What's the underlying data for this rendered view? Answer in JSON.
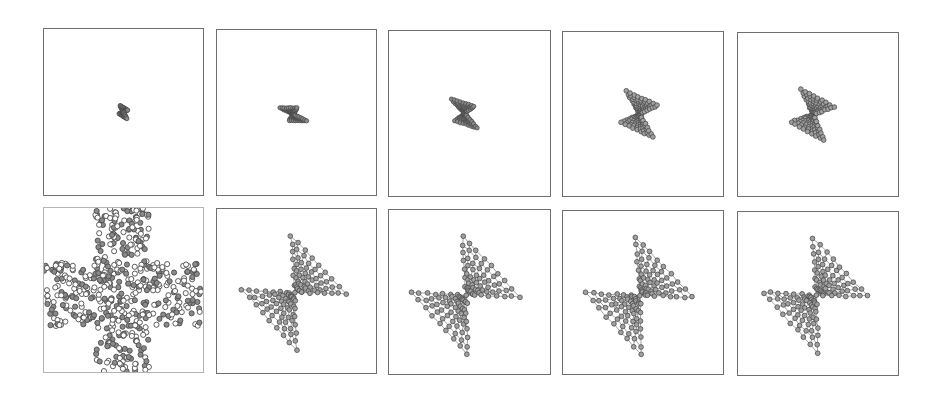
{
  "figure": {
    "colors": {
      "background": "#ffffff",
      "border": "#6e6e6e",
      "border_light": "#b4b4b4",
      "node_stroke": "#4a4a4a",
      "node_fill": "#8a8a8a",
      "edge": "#7a7a7a"
    },
    "rows": [
      {
        "label": "row-1",
        "panels": [
          {
            "id": "p1",
            "x": 43,
            "y": 28,
            "w": 161,
            "h": 168,
            "kind": "bowtie",
            "scale": 0.1,
            "rot": -25,
            "cx": 0.5,
            "cy": 0.5,
            "spread": 0.55,
            "border": "dark"
          },
          {
            "id": "p2",
            "x": 216,
            "y": 29,
            "w": 161,
            "h": 167,
            "kind": "bowtie",
            "scale": 0.2,
            "rot": -62,
            "cx": 0.48,
            "cy": 0.51,
            "spread": 0.35,
            "border": "dark"
          },
          {
            "id": "p3",
            "x": 388,
            "y": 30,
            "w": 163,
            "h": 167,
            "kind": "bowtie",
            "scale": 0.26,
            "rot": -40,
            "cx": 0.47,
            "cy": 0.5,
            "spread": 0.55,
            "border": "dark"
          },
          {
            "id": "p4",
            "x": 562,
            "y": 31,
            "w": 162,
            "h": 166,
            "kind": "bowtie",
            "scale": 0.36,
            "rot": -28,
            "cx": 0.48,
            "cy": 0.5,
            "spread": 0.75,
            "border": "dark"
          },
          {
            "id": "p5",
            "x": 737,
            "y": 32,
            "w": 162,
            "h": 165,
            "kind": "bowtie",
            "scale": 0.38,
            "rot": -22,
            "cx": 0.47,
            "cy": 0.5,
            "spread": 0.85,
            "border": "dark"
          }
        ]
      },
      {
        "label": "row-2",
        "panels": [
          {
            "id": "p6",
            "x": 43,
            "y": 207,
            "w": 161,
            "h": 166,
            "kind": "cross",
            "border": "light"
          },
          {
            "id": "p7",
            "x": 216,
            "y": 208,
            "w": 161,
            "h": 166,
            "kind": "bowtie",
            "scale": 0.78,
            "rot": 0,
            "cx": 0.49,
            "cy": 0.51,
            "spread": 1.0,
            "border": "dark"
          },
          {
            "id": "p8",
            "x": 388,
            "y": 209,
            "w": 163,
            "h": 166,
            "kind": "bowtie",
            "scale": 0.8,
            "rot": 0,
            "cx": 0.48,
            "cy": 0.52,
            "spread": 1.0,
            "border": "dark"
          },
          {
            "id": "p9",
            "x": 562,
            "y": 210,
            "w": 162,
            "h": 165,
            "kind": "bowtie",
            "scale": 0.8,
            "rot": 0,
            "cx": 0.48,
            "cy": 0.52,
            "spread": 1.0,
            "border": "dark"
          },
          {
            "id": "p10",
            "x": 737,
            "y": 211,
            "w": 162,
            "h": 165,
            "kind": "bowtie",
            "scale": 0.78,
            "rot": 0,
            "cx": 0.49,
            "cy": 0.51,
            "spread": 1.0,
            "border": "dark"
          }
        ]
      }
    ],
    "graph": {
      "type": "bowtie-mesh",
      "wings": 2,
      "radial_rings": 7,
      "spokes_per_wing": 9,
      "node_radius": 2.4,
      "cross_node_count": 520,
      "cross_node_radius": 2.6
    }
  }
}
